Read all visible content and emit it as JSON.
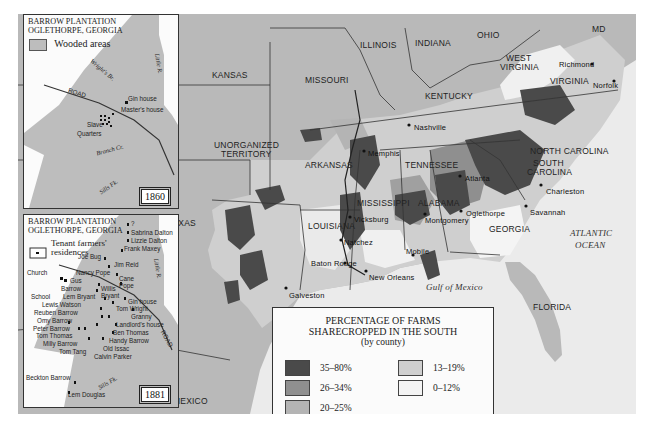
{
  "main_map": {
    "states": [
      {
        "label": "KANSAS",
        "x": 212,
        "y": 70
      },
      {
        "label": "MISSOURI",
        "x": 305,
        "y": 75
      },
      {
        "label": "ILLINOIS",
        "x": 360,
        "y": 40
      },
      {
        "label": "INDIANA",
        "x": 415,
        "y": 38
      },
      {
        "label": "OHIO",
        "x": 477,
        "y": 30
      },
      {
        "label": "WEST",
        "x": 506,
        "y": 53
      },
      {
        "label": "VIRGINIA",
        "x": 500,
        "y": 62
      },
      {
        "label": "MD",
        "x": 592,
        "y": 24
      },
      {
        "label": "KENTUCKY",
        "x": 425,
        "y": 91
      },
      {
        "label": "VIRGINIA",
        "x": 550,
        "y": 76
      },
      {
        "label": "NORTH CAROLINA",
        "x": 530,
        "y": 146
      },
      {
        "label": "TENNESSEE",
        "x": 405,
        "y": 160
      },
      {
        "label": "UNORGANIZED",
        "x": 214,
        "y": 140
      },
      {
        "label": "TERRITORY",
        "x": 221,
        "y": 149
      },
      {
        "label": "ARKANSAS",
        "x": 305,
        "y": 160
      },
      {
        "label": "SOUTH",
        "x": 533,
        "y": 158
      },
      {
        "label": "CAROLINA",
        "x": 527,
        "y": 167
      },
      {
        "label": "MISSISSIPPI",
        "x": 357,
        "y": 198
      },
      {
        "label": "ALABAMA",
        "x": 418,
        "y": 198
      },
      {
        "label": "GEORGIA",
        "x": 489,
        "y": 224
      },
      {
        "label": "LOUISIANA",
        "x": 308,
        "y": 221
      },
      {
        "label": "TEXAS",
        "x": 167,
        "y": 218
      },
      {
        "label": "FLORIDA",
        "x": 533,
        "y": 302
      },
      {
        "label": "MEXICO",
        "x": 173,
        "y": 396
      }
    ],
    "cities": [
      {
        "label": "Richmond",
        "x": 559,
        "y": 60,
        "dot_x": 592,
        "dot_y": 64
      },
      {
        "label": "Norfolk",
        "x": 593,
        "y": 81,
        "dot_x": 614,
        "dot_y": 81
      },
      {
        "label": "Nashville",
        "x": 414,
        "y": 123,
        "dot_x": 409,
        "dot_y": 125
      },
      {
        "label": "Memphis",
        "x": 368,
        "y": 149,
        "dot_x": 364,
        "dot_y": 151
      },
      {
        "label": "Atlanta",
        "x": 465,
        "y": 174,
        "dot_x": 460,
        "dot_y": 176
      },
      {
        "label": "Charleston",
        "x": 546,
        "y": 187,
        "dot_x": 541,
        "dot_y": 185
      },
      {
        "label": "Oglethorpe",
        "x": 466,
        "y": 209,
        "dot_x": 461,
        "dot_y": 211
      },
      {
        "label": "Savannah",
        "x": 530,
        "y": 208,
        "dot_x": 526,
        "dot_y": 206
      },
      {
        "label": "Montgomery",
        "x": 425,
        "y": 216,
        "dot_x": 425,
        "dot_y": 214
      },
      {
        "label": "Vicksburg",
        "x": 354,
        "y": 215,
        "dot_x": 350,
        "dot_y": 217
      },
      {
        "label": "Natchez",
        "x": 344,
        "y": 238,
        "dot_x": 341,
        "dot_y": 240
      },
      {
        "label": "Mobile",
        "x": 406,
        "y": 247,
        "dot_x": 413,
        "dot_y": 255
      },
      {
        "label": "Baton Rouge",
        "x": 311,
        "y": 259,
        "dot_x": 345,
        "dot_y": 263
      },
      {
        "label": "New Orleans",
        "x": 369,
        "y": 273,
        "dot_x": 366,
        "dot_y": 271
      },
      {
        "label": "Galveston",
        "x": 289,
        "y": 291,
        "dot_x": 286,
        "dot_y": 288
      }
    ],
    "water": [
      {
        "label": "Gulf of Mexico",
        "x": 426,
        "y": 282
      },
      {
        "label": "ATLANTIC",
        "x": 570,
        "y": 228
      },
      {
        "label": "OCEAN",
        "x": 575,
        "y": 240
      }
    ]
  },
  "inset_1860": {
    "title_line1": "BARROW PLANTATION",
    "title_line2": "OGLETHORPE, GEORGIA",
    "legend_label": "Wooded areas",
    "year": "1860",
    "labels": [
      {
        "text": "Gin house",
        "x": 127,
        "y": 97
      },
      {
        "text": "Master's house",
        "x": 120,
        "y": 108
      },
      {
        "text": "Slave",
        "x": 86,
        "y": 123
      },
      {
        "text": "Quarters",
        "x": 76,
        "y": 132
      },
      {
        "text": "ROAD",
        "x": 67,
        "y": 91
      }
    ],
    "streams": [
      {
        "text": "Wright's Br.",
        "x": 87,
        "y": 68
      },
      {
        "text": "Little R.",
        "x": 143,
        "y": 62
      },
      {
        "text": "Branch Cr.",
        "x": 95,
        "y": 148
      },
      {
        "text": "Sills Fk.",
        "x": 97,
        "y": 185
      }
    ]
  },
  "inset_1881": {
    "title_line1": "BARROW PLANTATION",
    "title_line2": "OGLETHORPE, GEORGIA",
    "legend_label_line1": "Tenant farmers'",
    "legend_label_line2": "residences",
    "year": "1881",
    "residents": [
      {
        "text": "?",
        "x": 130,
        "y": 224
      },
      {
        "text": "Sabrina Dalton",
        "x": 130,
        "y": 233
      },
      {
        "text": "Lizzie Dalton",
        "x": 130,
        "y": 241
      },
      {
        "text": "Frank Maxey",
        "x": 123,
        "y": 249
      },
      {
        "text": "Joe Bug",
        "x": 77,
        "y": 257
      },
      {
        "text": "Jim Reid",
        "x": 113,
        "y": 265
      },
      {
        "text": "Church",
        "x": 26,
        "y": 273
      },
      {
        "text": "Nancy Pope",
        "x": 75,
        "y": 273
      },
      {
        "text": "Cane",
        "x": 118,
        "y": 279
      },
      {
        "text": "Gus",
        "x": 69,
        "y": 281
      },
      {
        "text": "Pope",
        "x": 118,
        "y": 286
      },
      {
        "text": "Barrow",
        "x": 60,
        "y": 289
      },
      {
        "text": "Willis",
        "x": 100,
        "y": 289
      },
      {
        "text": "School",
        "x": 30,
        "y": 297
      },
      {
        "text": "Lem Bryant",
        "x": 62,
        "y": 297
      },
      {
        "text": "Bryant",
        "x": 100,
        "y": 296
      },
      {
        "text": "Gin house",
        "x": 127,
        "y": 302
      },
      {
        "text": "Lewis Watson",
        "x": 41,
        "y": 305
      },
      {
        "text": "Reuben Barrow",
        "x": 33,
        "y": 313
      },
      {
        "text": "Tom Wright",
        "x": 115,
        "y": 309
      },
      {
        "text": "Granny",
        "x": 130,
        "y": 317
      },
      {
        "text": "Omy Barrow",
        "x": 36,
        "y": 321
      },
      {
        "text": "Landlord's house",
        "x": 115,
        "y": 325
      },
      {
        "text": "Peter Barrow",
        "x": 32,
        "y": 329
      },
      {
        "text": "Tom Thomas",
        "x": 35,
        "y": 336
      },
      {
        "text": "Ben Thomas",
        "x": 112,
        "y": 333
      },
      {
        "text": "Handy Barrow",
        "x": 108,
        "y": 341
      },
      {
        "text": "Milly Barrow",
        "x": 42,
        "y": 344
      },
      {
        "text": "Old Issac",
        "x": 102,
        "y": 349
      },
      {
        "text": "Tom Tang",
        "x": 58,
        "y": 352
      },
      {
        "text": "Calvin Parker",
        "x": 93,
        "y": 357
      },
      {
        "text": "Beckton Barrow",
        "x": 25,
        "y": 378
      },
      {
        "text": "Lem Douglas",
        "x": 67,
        "y": 395
      }
    ],
    "road_label": "ROAD",
    "streams": [
      {
        "text": "Little R.",
        "x": 143,
        "y": 258
      },
      {
        "text": "Sills Fk.",
        "x": 96,
        "y": 381
      }
    ]
  },
  "legend": {
    "title_line1": "PERCENTAGE OF FARMS",
    "title_line2": "SHARECROPPED IN THE SOUTH",
    "subtitle": "(by county)",
    "items": [
      {
        "label": "35–80%",
        "color": "#4a4a4a"
      },
      {
        "label": "26–34%",
        "color": "#8f8f8f"
      },
      {
        "label": "20–25%",
        "color": "#b4b4b4"
      },
      {
        "label": "13–19%",
        "color": "#cfcfcf"
      },
      {
        "label": "0–12%",
        "color": "#f4f4f4"
      }
    ]
  },
  "colors": {
    "ocean": "#ebebeb",
    "other_land": "#b9b9b9",
    "wooded": "#bdbdbd",
    "borders": "#333333"
  }
}
